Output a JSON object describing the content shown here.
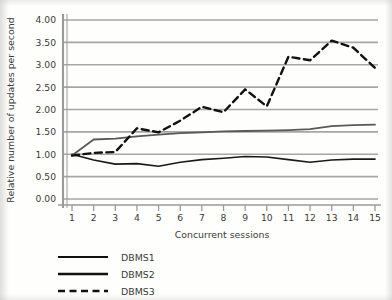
{
  "chart_data": {
    "type": "line",
    "title": "",
    "xlabel": "Concurrent sessions",
    "ylabel": "Relative number of updates per second",
    "x": [
      1,
      2,
      3,
      4,
      5,
      6,
      7,
      8,
      9,
      10,
      11,
      12,
      13,
      14,
      15
    ],
    "xtick_labels": [
      "1",
      "2",
      "3",
      "4",
      "5",
      "6",
      "7",
      "8",
      "9",
      "10",
      "11",
      "12",
      "13",
      "14",
      "15"
    ],
    "ytick_labels": [
      "0.00",
      "0.50",
      "1.00",
      "1.50",
      "2.00",
      "2.50",
      "3.00",
      "3.50",
      "4.00"
    ],
    "ytick_values": [
      0.0,
      0.5,
      1.0,
      1.5,
      2.0,
      2.5,
      3.0,
      3.5,
      4.0
    ],
    "ylim": [
      0.0,
      4.0
    ],
    "xlim": [
      1,
      15
    ],
    "grid": "horizontal",
    "legend_position": "below-left",
    "series": [
      {
        "name": "DBMS1",
        "style": "solid",
        "color": "#1a1a1a",
        "width": 1.6,
        "values": [
          1.0,
          0.87,
          0.78,
          0.79,
          0.73,
          0.82,
          0.88,
          0.91,
          0.95,
          0.94,
          0.88,
          0.82,
          0.87,
          0.89,
          0.89
        ]
      },
      {
        "name": "DBMS2",
        "style": "solid",
        "color": "#59595a",
        "width": 1.8,
        "values": [
          0.97,
          1.33,
          1.35,
          1.4,
          1.44,
          1.47,
          1.49,
          1.51,
          1.52,
          1.53,
          1.54,
          1.56,
          1.63,
          1.65,
          1.66
        ]
      },
      {
        "name": "DBMS3",
        "style": "dashed",
        "color": "#111111",
        "width": 2.4,
        "values": [
          0.97,
          1.03,
          1.05,
          1.58,
          1.49,
          1.75,
          2.06,
          1.94,
          2.45,
          2.07,
          3.18,
          3.1,
          3.54,
          3.38,
          2.93
        ]
      }
    ],
    "colors": {
      "gridline": "#a6a6a6",
      "axis": "#9a9a9a",
      "text": "#3a3a38",
      "background": "#fefefd"
    }
  },
  "legend": {
    "items": [
      {
        "label": "DBMS1"
      },
      {
        "label": "DBMS2"
      },
      {
        "label": "DBMS3"
      }
    ]
  }
}
